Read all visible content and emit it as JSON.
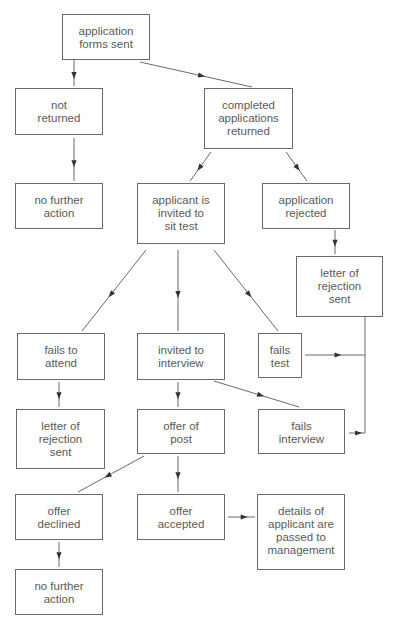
{
  "diagram": {
    "type": "flowchart",
    "colors": {
      "stroke": "#6a6a6a",
      "text": "#5a5a5a",
      "background": "#ffffff"
    },
    "nodes": [
      {
        "id": "forms_sent",
        "label": "application\nforms sent",
        "x": 62,
        "y": 14,
        "w": 88,
        "h": 46
      },
      {
        "id": "not_returned",
        "label": "not\nreturned",
        "x": 15,
        "y": 88,
        "w": 88,
        "h": 47
      },
      {
        "id": "completed_returned",
        "label": "completed\napplications\nreturned",
        "x": 204,
        "y": 88,
        "w": 89,
        "h": 61
      },
      {
        "id": "no_further_action_1",
        "label": "no further\naction",
        "x": 15,
        "y": 183,
        "w": 88,
        "h": 46
      },
      {
        "id": "invited_sit_test",
        "label": "applicant is\ninvited to\nsit test",
        "x": 137,
        "y": 183,
        "w": 88,
        "h": 61
      },
      {
        "id": "application_rejected",
        "label": "application\nrejected",
        "x": 262,
        "y": 183,
        "w": 88,
        "h": 46
      },
      {
        "id": "rejection_letter_right",
        "label": "letter of\nrejection\nsent",
        "x": 296,
        "y": 256,
        "w": 87,
        "h": 61
      },
      {
        "id": "fails_to_attend",
        "label": "fails to\nattend",
        "x": 17,
        "y": 333,
        "w": 88,
        "h": 47
      },
      {
        "id": "invited_interview",
        "label": "invited to\ninterview",
        "x": 137,
        "y": 333,
        "w": 88,
        "h": 47
      },
      {
        "id": "fails_test",
        "label": "fails\ntest",
        "x": 258,
        "y": 333,
        "w": 44,
        "h": 45
      },
      {
        "id": "rejection_letter_left",
        "label": "letter of\nrejection\nsent",
        "x": 16,
        "y": 409,
        "w": 89,
        "h": 60
      },
      {
        "id": "offer_of_post",
        "label": "offer of\npost",
        "x": 137,
        "y": 409,
        "w": 88,
        "h": 45
      },
      {
        "id": "fails_interview",
        "label": "fails\ninterview",
        "x": 258,
        "y": 409,
        "w": 87,
        "h": 45
      },
      {
        "id": "offer_declined",
        "label": "offer\ndeclined",
        "x": 15,
        "y": 494,
        "w": 88,
        "h": 46
      },
      {
        "id": "offer_accepted",
        "label": "offer\naccepted",
        "x": 137,
        "y": 494,
        "w": 88,
        "h": 46
      },
      {
        "id": "passed_to_management",
        "label": "details of\napplicant are\npassed to\nmanagement",
        "x": 257,
        "y": 494,
        "w": 88,
        "h": 76
      },
      {
        "id": "no_further_action_2",
        "label": "no further\naction",
        "x": 15,
        "y": 569,
        "w": 88,
        "h": 46
      }
    ],
    "edges": [
      {
        "from": "forms_sent",
        "to": "not_returned",
        "points": [
          [
            74,
            60
          ],
          [
            74,
            86
          ]
        ],
        "arrow_at": 0.6
      },
      {
        "from": "forms_sent",
        "to": "completed_returned",
        "points": [
          [
            140,
            62
          ],
          [
            252,
            87
          ]
        ],
        "arrow_at": 0.55
      },
      {
        "from": "not_returned",
        "to": "no_further_action_1",
        "points": [
          [
            74,
            138
          ],
          [
            74,
            181
          ]
        ],
        "arrow_at": 0.6
      },
      {
        "from": "completed_returned",
        "to": "invited_sit_test",
        "points": [
          [
            211,
            152
          ],
          [
            190,
            181
          ]
        ],
        "arrow_at": 0.55
      },
      {
        "from": "completed_returned",
        "to": "application_rejected",
        "points": [
          [
            286,
            152
          ],
          [
            307,
            181
          ]
        ],
        "arrow_at": 0.55
      },
      {
        "from": "application_rejected",
        "to": "rejection_letter_right",
        "points": [
          [
            335,
            230
          ],
          [
            335,
            254
          ]
        ],
        "arrow_at": 0.55
      },
      {
        "from": "invited_sit_test",
        "to": "fails_to_attend",
        "points": [
          [
            146,
            250
          ],
          [
            82,
            331
          ]
        ],
        "arrow_at": 0.55
      },
      {
        "from": "invited_sit_test",
        "to": "invited_interview",
        "points": [
          [
            178,
            250
          ],
          [
            178,
            331
          ]
        ],
        "arrow_at": 0.55
      },
      {
        "from": "invited_sit_test",
        "to": "fails_test",
        "points": [
          [
            214,
            250
          ],
          [
            278,
            331
          ]
        ],
        "arrow_at": 0.55
      },
      {
        "from": "fails_to_attend",
        "to": "rejection_letter_left",
        "points": [
          [
            59,
            382
          ],
          [
            59,
            407
          ]
        ],
        "arrow_at": 0.55
      },
      {
        "from": "invited_interview",
        "to": "offer_of_post",
        "points": [
          [
            178,
            382
          ],
          [
            178,
            407
          ]
        ],
        "arrow_at": 0.55
      },
      {
        "from": "invited_interview",
        "to": "fails_interview",
        "points": [
          [
            214,
            381
          ],
          [
            299,
            407
          ]
        ],
        "arrow_at": 0.55
      },
      {
        "from": "fails_test",
        "to": "rejection_letter_right",
        "points": [
          [
            305,
            355
          ],
          [
            365,
            355
          ]
        ],
        "arrow_at": 0.55,
        "line_only": false
      },
      {
        "from": "fails_interview",
        "to": "rejection_letter_right",
        "points": [
          [
            349,
            433
          ],
          [
            365,
            433
          ]
        ],
        "arrow_at": 0.6
      },
      {
        "from": "rejection_letter_right",
        "to": "merge",
        "points": [
          [
            365,
            317
          ],
          [
            365,
            433
          ]
        ],
        "arrow_at": -1
      },
      {
        "from": "offer_of_post",
        "to": "offer_declined",
        "points": [
          [
            144,
            456
          ],
          [
            78,
            492
          ]
        ],
        "arrow_at": 0.55
      },
      {
        "from": "offer_of_post",
        "to": "offer_accepted",
        "points": [
          [
            178,
            456
          ],
          [
            178,
            492
          ]
        ],
        "arrow_at": 0.55
      },
      {
        "from": "offer_accepted",
        "to": "passed_to_management",
        "points": [
          [
            228,
            517
          ],
          [
            255,
            517
          ]
        ],
        "arrow_at": 0.6
      },
      {
        "from": "offer_declined",
        "to": "no_further_action_2",
        "points": [
          [
            59,
            542
          ],
          [
            59,
            567
          ]
        ],
        "arrow_at": 0.55
      }
    ]
  }
}
